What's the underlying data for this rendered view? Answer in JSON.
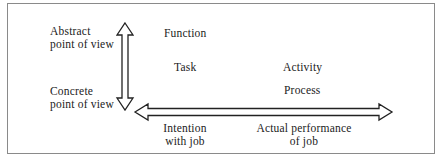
{
  "diagram": {
    "vertical_axis": {
      "top_label_line1": "Abstract",
      "top_label_line2": "point of view",
      "bottom_label_line1": "Concrete",
      "bottom_label_line2": "point of view"
    },
    "horizontal_axis": {
      "left_label_line1": "Intention",
      "left_label_line2": "with job",
      "right_label_line1": "Actual performance",
      "right_label_line2": "of job"
    },
    "cells": {
      "function": "Function",
      "task": "Task",
      "activity": "Activity",
      "process": "Process"
    },
    "colors": {
      "stroke": "#222222",
      "frame": "#8a8a8a",
      "background": "#ffffff"
    }
  }
}
